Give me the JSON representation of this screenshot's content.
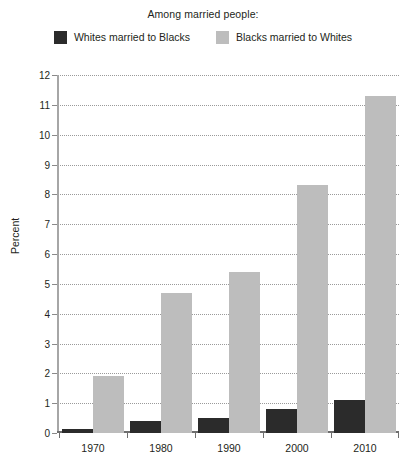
{
  "header": {
    "subtitle": "Among married people:"
  },
  "legend": {
    "position": "top-center",
    "items": [
      {
        "label": "Whites married to Blacks",
        "color": "#2b2b2b",
        "swatch_name": "legend-swatch-dark"
      },
      {
        "label": "Blacks married to Whites",
        "color": "#bdbdbd",
        "swatch_name": "legend-swatch-gray"
      }
    ]
  },
  "chart_data": {
    "type": "bar",
    "title": "Among married people:",
    "xlabel": "",
    "ylabel": "Percent",
    "categories": [
      "1970",
      "1980",
      "1990",
      "2000",
      "2010"
    ],
    "ylim": [
      0,
      12
    ],
    "yticks": [
      0,
      1,
      2,
      3,
      4,
      5,
      6,
      7,
      8,
      9,
      10,
      11,
      12
    ],
    "grid": true,
    "grid_style": "dotted-horizontal",
    "series": [
      {
        "name": "Whites married to Blacks",
        "color": "#2b2b2b",
        "values": [
          0.15,
          0.4,
          0.5,
          0.8,
          1.1
        ]
      },
      {
        "name": "Blacks married to Whites",
        "color": "#bdbdbd",
        "values": [
          1.9,
          4.7,
          5.4,
          8.3,
          11.3
        ]
      }
    ]
  }
}
